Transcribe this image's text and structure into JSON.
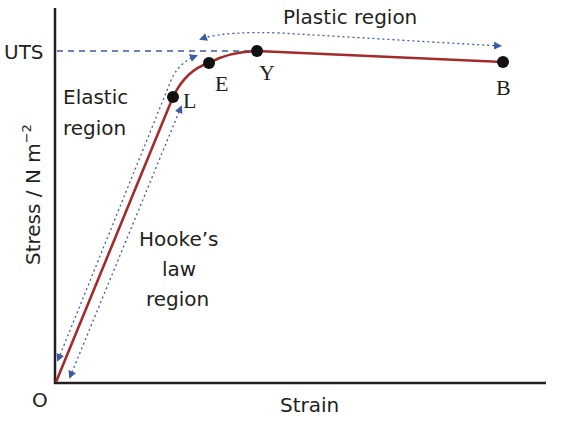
{
  "diagram": {
    "axes": {
      "y_label": "Stress / N m",
      "y_label_superscript": "−2",
      "x_label": "Strain",
      "origin_label": "O",
      "uts_label": "UTS"
    },
    "points": {
      "L": {
        "label": "L",
        "x": 173,
        "y": 97
      },
      "E": {
        "label": "E",
        "x": 209,
        "y": 63
      },
      "Y": {
        "label": "Y",
        "x": 257,
        "y": 51
      },
      "B": {
        "label": "B",
        "x": 503,
        "y": 62
      }
    },
    "regions": {
      "plastic": "Plastic region",
      "elastic_line1": "Elastic",
      "elastic_line2": "region",
      "hooke_line1": "Hooke’s",
      "hooke_line2": "law",
      "hooke_line3": "region"
    },
    "colors": {
      "curve": "#a52a2a",
      "axis": "#231f20",
      "annotation": "#3b5ba5",
      "point": "#111111",
      "text": "#231f20"
    }
  }
}
